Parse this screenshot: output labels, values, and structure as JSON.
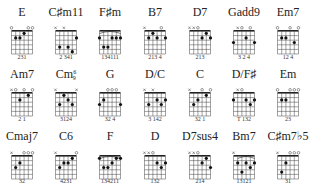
{
  "layout": {
    "columns": [
      22,
      66,
      110,
      155,
      200,
      244,
      288
    ],
    "rows": [
      {
        "name_y": 16,
        "grid_top": 31,
        "finger_y": 59
      },
      {
        "name_y": 78,
        "grid_top": 93,
        "finger_y": 121
      },
      {
        "name_y": 140,
        "grid_top": 156,
        "finger_y": 183
      }
    ],
    "string_spacing": 4.2,
    "fret_spacing": 4.6,
    "frets": 5
  },
  "chords": [
    {
      "name": "E",
      "row": 0,
      "col": 0,
      "top": [
        "o",
        "",
        "",
        "",
        "o",
        "o"
      ],
      "dots": [
        [
          1,
          2
        ],
        [
          2,
          2
        ],
        [
          3,
          1
        ]
      ],
      "barre": null,
      "fingering": "231"
    },
    {
      "name": "C♯m11",
      "row": 0,
      "col": 1,
      "top": [
        "x",
        "",
        "x",
        "",
        "",
        ""
      ],
      "dots": [
        [
          1,
          4
        ],
        [
          3,
          4
        ],
        [
          4,
          5
        ],
        [
          5,
          2
        ]
      ],
      "barre": null,
      "fingering": "2 341"
    },
    {
      "name": "F♯m",
      "row": 0,
      "col": 2,
      "top": [
        "",
        "",
        "",
        "",
        "",
        ""
      ],
      "dots": [
        [
          0,
          2
        ],
        [
          1,
          4
        ],
        [
          2,
          4
        ],
        [
          3,
          2
        ],
        [
          4,
          2
        ],
        [
          5,
          2
        ]
      ],
      "barre": [
        0,
        5,
        2
      ],
      "fingering": "134111"
    },
    {
      "name": "B7",
      "row": 0,
      "col": 3,
      "top": [
        "x",
        "",
        "",
        "",
        "o",
        ""
      ],
      "dots": [
        [
          1,
          2
        ],
        [
          2,
          1
        ],
        [
          3,
          2
        ],
        [
          5,
          2
        ]
      ],
      "barre": null,
      "fingering": "213 4"
    },
    {
      "name": "D7",
      "row": 0,
      "col": 4,
      "top": [
        "x",
        "x",
        "o",
        "",
        "",
        ""
      ],
      "dots": [
        [
          3,
          2
        ],
        [
          4,
          1
        ],
        [
          5,
          2
        ]
      ],
      "barre": null,
      "fingering": "213"
    },
    {
      "name": "Gadd9",
      "row": 0,
      "col": 5,
      "top": [
        "",
        "x",
        "o",
        "",
        "o",
        ""
      ],
      "dots": [
        [
          0,
          3
        ],
        [
          3,
          2
        ],
        [
          5,
          3
        ]
      ],
      "barre": null,
      "fingering": "3  2  4"
    },
    {
      "name": "Em7",
      "row": 0,
      "col": 6,
      "top": [
        "o",
        "",
        "",
        "o",
        "",
        "o"
      ],
      "dots": [
        [
          1,
          2
        ],
        [
          2,
          2
        ],
        [
          4,
          3
        ]
      ],
      "barre": null,
      "fingering": "12 4"
    },
    {
      "name": "Am7",
      "row": 1,
      "col": 0,
      "top": [
        "x",
        "o",
        "",
        "o",
        "",
        "o"
      ],
      "dots": [
        [
          2,
          2
        ],
        [
          4,
          1
        ]
      ],
      "barre": null,
      "fingering": "2 1"
    },
    {
      "name": "Cm",
      "sup": "6",
      "sub": "9",
      "row": 1,
      "col": 1,
      "top": [
        "x",
        "",
        "",
        "",
        "",
        "x"
      ],
      "dots": [
        [
          1,
          3
        ],
        [
          2,
          1
        ],
        [
          3,
          2
        ],
        [
          4,
          3
        ]
      ],
      "barre": null,
      "fingering": "3124"
    },
    {
      "name": "G",
      "row": 1,
      "col": 2,
      "top": [
        "",
        "",
        "o",
        "o",
        "o",
        ""
      ],
      "dots": [
        [
          0,
          3
        ],
        [
          1,
          2
        ],
        [
          5,
          3
        ]
      ],
      "barre": null,
      "fingering": "32   4"
    },
    {
      "name": "D/C",
      "row": 1,
      "col": 3,
      "top": [
        "x",
        "",
        "x",
        "",
        "",
        ""
      ],
      "dots": [
        [
          1,
          3
        ],
        [
          3,
          2
        ],
        [
          4,
          3
        ],
        [
          5,
          2
        ]
      ],
      "barre": null,
      "fingering": "3 142"
    },
    {
      "name": "C",
      "row": 1,
      "col": 4,
      "top": [
        "x",
        "",
        "",
        "o",
        "",
        "o"
      ],
      "dots": [
        [
          1,
          3
        ],
        [
          2,
          2
        ],
        [
          4,
          1
        ]
      ],
      "barre": null,
      "fingering": "32 1"
    },
    {
      "name": "D/F♯",
      "row": 1,
      "col": 5,
      "top": [
        "",
        "x",
        "o",
        "",
        "",
        ""
      ],
      "dots": [
        [
          0,
          2
        ],
        [
          3,
          2
        ],
        [
          4,
          3
        ],
        [
          5,
          2
        ]
      ],
      "barre": null,
      "fingering": "T  132"
    },
    {
      "name": "Em",
      "row": 1,
      "col": 6,
      "top": [
        "o",
        "",
        "",
        "o",
        "o",
        "o"
      ],
      "dots": [
        [
          1,
          2
        ],
        [
          2,
          2
        ]
      ],
      "barre": null,
      "fingering": "23"
    },
    {
      "name": "Cmaj7",
      "row": 2,
      "col": 0,
      "top": [
        "x",
        "",
        "",
        "o",
        "o",
        "o"
      ],
      "dots": [
        [
          1,
          3
        ],
        [
          2,
          2
        ]
      ],
      "barre": null,
      "fingering": "32"
    },
    {
      "name": "C6",
      "row": 2,
      "col": 1,
      "top": [
        "x",
        "",
        "",
        "",
        "",
        "o"
      ],
      "dots": [
        [
          1,
          3
        ],
        [
          2,
          2
        ],
        [
          3,
          2
        ],
        [
          4,
          1
        ]
      ],
      "barre": null,
      "fingering": "4231"
    },
    {
      "name": "F",
      "row": 2,
      "col": 2,
      "top": [
        "",
        "",
        "",
        "",
        "",
        ""
      ],
      "dots": [
        [
          0,
          1
        ],
        [
          1,
          3
        ],
        [
          2,
          3
        ],
        [
          3,
          2
        ],
        [
          4,
          1
        ],
        [
          5,
          1
        ]
      ],
      "barre": [
        0,
        5,
        1
      ],
      "fingering": "134211"
    },
    {
      "name": "D",
      "row": 2,
      "col": 3,
      "top": [
        "x",
        "x",
        "o",
        "",
        "",
        ""
      ],
      "dots": [
        [
          3,
          2
        ],
        [
          4,
          3
        ],
        [
          5,
          2
        ]
      ],
      "barre": null,
      "fingering": "132"
    },
    {
      "name": "D7sus4",
      "row": 2,
      "col": 4,
      "top": [
        "x",
        "x",
        "o",
        "",
        "",
        ""
      ],
      "dots": [
        [
          3,
          2
        ],
        [
          4,
          1
        ],
        [
          5,
          3
        ]
      ],
      "barre": null,
      "fingering": "214"
    },
    {
      "name": "Bm7",
      "row": 2,
      "col": 5,
      "top": [
        "x",
        "",
        "",
        "",
        "",
        ""
      ],
      "dots": [
        [
          1,
          2
        ],
        [
          2,
          4
        ],
        [
          3,
          2
        ],
        [
          4,
          3
        ],
        [
          5,
          2
        ]
      ],
      "barre": [
        1,
        5,
        2
      ],
      "fingering": "13121"
    },
    {
      "name": "C♯m7♭5",
      "row": 2,
      "col": 6,
      "top": [
        "x",
        "",
        "",
        "o",
        "o",
        "o"
      ],
      "dots": [
        [
          1,
          4
        ],
        [
          2,
          2
        ]
      ],
      "barre": null,
      "fingering": "31"
    }
  ]
}
